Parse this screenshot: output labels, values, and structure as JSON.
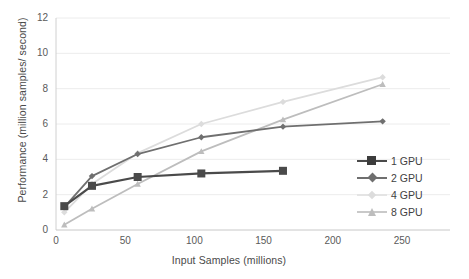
{
  "chart_data": {
    "type": "line",
    "title": "",
    "xlabel": "Input Samples (millions)",
    "ylabel": "Performance (million samples/ second)",
    "xlim": [
      0,
      250
    ],
    "ylim": [
      0,
      12
    ],
    "xticks": [
      "0",
      "50",
      "100",
      "150",
      "200",
      "250"
    ],
    "yticks": [
      "0",
      "2",
      "4",
      "6",
      "8",
      "10",
      "12"
    ],
    "grid": "horizontal",
    "legend_position": "right-middle",
    "series": [
      {
        "name": "1 GPU",
        "color": "#4a4a4a",
        "marker": "square",
        "x": [
          6,
          26,
          59,
          105,
          164
        ],
        "values": [
          1.35,
          2.5,
          3.0,
          3.2,
          3.35
        ]
      },
      {
        "name": "2 GPU",
        "color": "#6f6f6f",
        "marker": "diamond",
        "x": [
          6,
          26,
          59,
          105,
          164,
          236
        ],
        "values": [
          1.3,
          3.05,
          4.3,
          5.25,
          5.85,
          6.15
        ]
      },
      {
        "name": "4 GPU",
        "color": "#dcdcdc",
        "marker": "cross",
        "x": [
          6,
          26,
          59,
          105,
          164,
          236
        ],
        "values": [
          1.0,
          2.6,
          4.35,
          6.0,
          7.25,
          8.65
        ]
      },
      {
        "name": "8 GPU",
        "color": "#bdbdbd",
        "marker": "triangle",
        "x": [
          6,
          26,
          59,
          105,
          164,
          236
        ],
        "values": [
          0.3,
          1.2,
          2.6,
          4.45,
          6.25,
          8.25
        ]
      }
    ]
  },
  "legend": {
    "items": [
      {
        "label": "1 GPU"
      },
      {
        "label": "2 GPU"
      },
      {
        "label": "4 GPU"
      },
      {
        "label": "8 GPU"
      }
    ]
  }
}
